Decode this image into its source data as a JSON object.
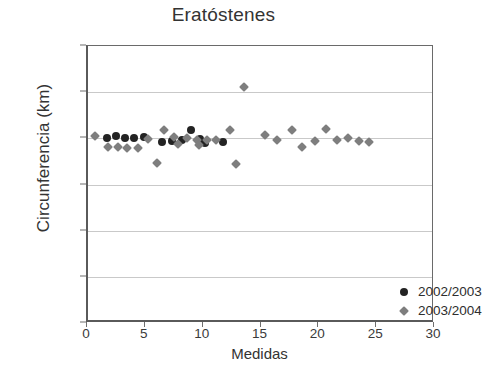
{
  "chart_data": {
    "type": "scatter",
    "title": "Eratóstenes",
    "xlabel": "Medidas",
    "ylabel": "Circunferencia (km)",
    "xlim": [
      0,
      30
    ],
    "ylim": [
      0,
      60000
    ],
    "xticks": [
      "0",
      "5",
      "10",
      "15",
      "20",
      "25",
      "30"
    ],
    "xtick_values": [
      0,
      5,
      10,
      15,
      20,
      25,
      30
    ],
    "yticks": [
      "0",
      "10.000",
      "20.000",
      "30.000",
      "40.000",
      "50.000",
      "60.000"
    ],
    "ytick_values": [
      0,
      10000,
      20000,
      30000,
      40000,
      50000,
      60000
    ],
    "grid": true,
    "grid_axis": "y",
    "legend_position": "inside-lower-right",
    "series": [
      {
        "name": "2002/2003",
        "marker": "circle",
        "color": "#232323",
        "points": [
          [
            1.6,
            40000
          ],
          [
            2.4,
            40400
          ],
          [
            3.2,
            40000
          ],
          [
            4.0,
            40000
          ],
          [
            4.8,
            40200
          ],
          [
            6.4,
            39300
          ],
          [
            7.3,
            39500
          ],
          [
            8.1,
            39700
          ],
          [
            8.9,
            41800
          ],
          [
            9.7,
            39900
          ],
          [
            10.1,
            39000
          ],
          [
            11.7,
            39300
          ]
        ]
      },
      {
        "name": "2003/2004",
        "marker": "diamond",
        "color": "#7e7e7e",
        "points": [
          [
            0.6,
            40500
          ],
          [
            1.7,
            38100
          ],
          [
            2.6,
            38100
          ],
          [
            3.4,
            38000
          ],
          [
            4.3,
            37900
          ],
          [
            5.2,
            39900
          ],
          [
            6.0,
            34600
          ],
          [
            6.6,
            41700
          ],
          [
            7.4,
            40300
          ],
          [
            7.8,
            38700
          ],
          [
            8.6,
            40000
          ],
          [
            9.4,
            39700
          ],
          [
            9.6,
            38600
          ],
          [
            10.3,
            39700
          ],
          [
            11.1,
            39700
          ],
          [
            12.3,
            41700
          ],
          [
            12.8,
            34500
          ],
          [
            13.5,
            51200
          ],
          [
            15.3,
            40800
          ],
          [
            16.3,
            39600
          ],
          [
            17.6,
            41700
          ],
          [
            18.5,
            38100
          ],
          [
            19.6,
            39400
          ],
          [
            20.6,
            42100
          ],
          [
            21.5,
            39600
          ],
          [
            22.5,
            40100
          ],
          [
            23.4,
            39500
          ],
          [
            24.3,
            39300
          ]
        ]
      }
    ]
  }
}
